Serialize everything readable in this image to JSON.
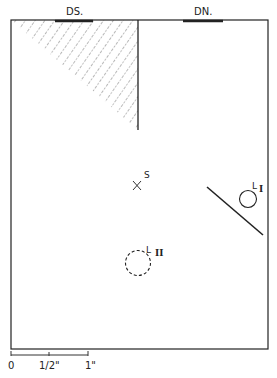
{
  "diagram": {
    "labels": {
      "door_left": "DS.",
      "door_right": "DN.",
      "source": "S",
      "light1_letter": "L",
      "light1_numeral": "I",
      "light2_letter": "L",
      "light2_numeral": "II"
    },
    "scale": {
      "ticks": [
        "0",
        "1/2\"",
        "1\""
      ]
    },
    "colors": {
      "ink": "#222222",
      "background": "#ffffff"
    }
  }
}
